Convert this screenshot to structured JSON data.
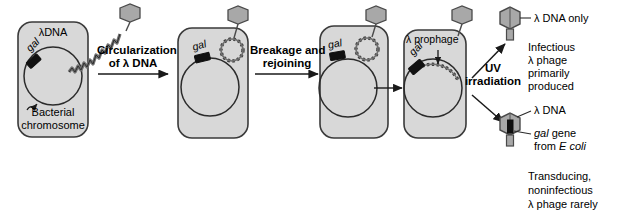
{
  "diagram": {
    "title_hidden": "Lambda phage specialized transduction",
    "colors": {
      "cell_fill": "#d8d8d8",
      "cell_stroke": "#3a3a3a",
      "phage_fill": "#a8a8a8",
      "phage_stroke": "#4a4a4a",
      "gal_fill": "#111111",
      "dna_stroke": "#333333",
      "text": "#000000"
    },
    "cells": [
      {
        "id": "cell-1",
        "top_label": "λDNA",
        "gal_label": "gal",
        "chromosome_label_line1": "Bacterial",
        "chromosome_label_line2": "chromosome"
      },
      {
        "id": "cell-2",
        "gal_label": "gal"
      },
      {
        "id": "cell-3",
        "gal_label": "gal"
      },
      {
        "id": "cell-4",
        "top_label": "λ prophage",
        "gal_label": "gal"
      }
    ],
    "steps": [
      {
        "id": "step-1",
        "line1": "Circularization",
        "line2": "of λ DNA"
      },
      {
        "id": "step-2",
        "line1": "Breakage and",
        "line2": "rejoining"
      },
      {
        "id": "step-3",
        "line1": "",
        "line2": ""
      },
      {
        "id": "step-4",
        "line1": "UV",
        "line2": "irradiation"
      }
    ],
    "outputs": [
      {
        "id": "output-top",
        "callout": "λ DNA only",
        "note_lines": [
          "Infectious",
          "λ phage",
          "primarily",
          "produced"
        ]
      },
      {
        "id": "output-bottom",
        "callout_1": "λ DNA",
        "callout_2_italic": "gal",
        "callout_2_rest": " gene",
        "callout_3_pre": "from ",
        "callout_3_italic": "E coli",
        "note_lines": [
          "Transducing,",
          "noninfectious",
          "λ phage rarely"
        ]
      }
    ]
  }
}
